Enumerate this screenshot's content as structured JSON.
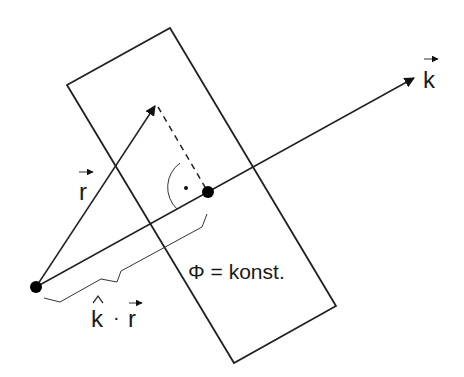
{
  "diagram": {
    "labels": {
      "k_vector": "k",
      "r_vector": "r",
      "projection": "k · r",
      "projection_k": "k",
      "projection_dot": "·",
      "projection_r": "r",
      "phase_plane": "Φ = konst."
    },
    "colors": {
      "stroke": "#222222",
      "background": "#ffffff"
    },
    "elements": [
      {
        "id": "phase-plane",
        "shape": "rectangle (rotated)",
        "corners": [
          [
            67,
            85
          ],
          [
            170,
            28
          ],
          [
            336,
            306
          ],
          [
            234,
            363
          ]
        ]
      },
      {
        "id": "k-vector",
        "from": [
          36,
          287
        ],
        "to": [
          417,
          76
        ]
      },
      {
        "id": "r-vector",
        "from": [
          36,
          287
        ],
        "to": [
          157,
          103
        ]
      },
      {
        "id": "projection-line",
        "style": "dashed",
        "from": [
          157,
          103
        ],
        "to": [
          208,
          192
        ]
      },
      {
        "id": "origin-point",
        "at": [
          36,
          287
        ]
      },
      {
        "id": "projection-point",
        "at": [
          208,
          192
        ]
      },
      {
        "id": "right-angle-marker",
        "at": [
          208,
          192
        ]
      },
      {
        "id": "brace",
        "from": [
          36,
          287
        ],
        "to": [
          208,
          192
        ]
      }
    ]
  }
}
